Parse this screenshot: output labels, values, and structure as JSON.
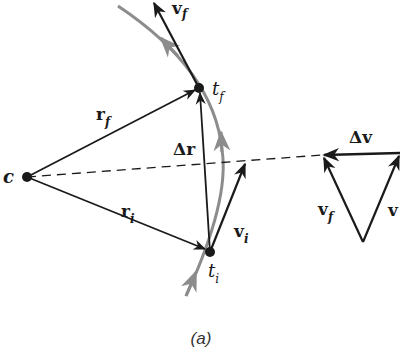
{
  "figure": {
    "caption": "(a)",
    "colors": {
      "ink": "#1a1a1a",
      "path": "#8c8c8c",
      "background": "#ffffff"
    }
  },
  "points": {
    "center": {
      "label": "c"
    },
    "final": {
      "label": "t",
      "subscript": "f"
    },
    "initial": {
      "label": "t",
      "subscript": "i"
    }
  },
  "vectors": {
    "r_f": {
      "symbol": "r",
      "subscript": "f"
    },
    "r_i": {
      "symbol": "r",
      "subscript": "i"
    },
    "delta_r": {
      "symbol": "Δr"
    },
    "v_f": {
      "symbol": "v",
      "subscript": "f"
    },
    "v_i": {
      "symbol": "v",
      "subscript": "i"
    }
  },
  "vector_triangle": {
    "delta_v": {
      "symbol": "Δv"
    },
    "v_f": {
      "symbol": "v",
      "subscript": "f"
    },
    "v_i": {
      "symbol": "v"
    }
  }
}
